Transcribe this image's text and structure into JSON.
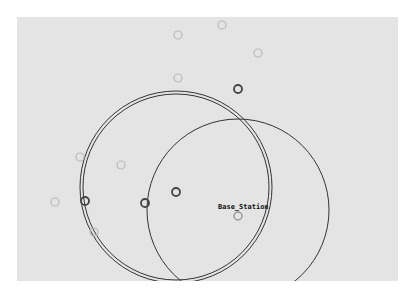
{
  "scene": {
    "panel": {
      "x": 17,
      "y": 17,
      "width": 381,
      "height": 264,
      "background": "#e4e4e4"
    },
    "base_station": {
      "label": "Base_Station",
      "x": 238,
      "y": 216
    },
    "range_circles": [
      {
        "name": "double-range-circle-outer",
        "cx": 176,
        "cy": 187,
        "r": 96
      },
      {
        "name": "double-range-circle-inner",
        "cx": 176,
        "cy": 187,
        "r": 93
      },
      {
        "name": "base-station-range-circle",
        "cx": 238,
        "cy": 210,
        "r": 91
      }
    ],
    "nodes": [
      {
        "x": 222,
        "y": 25,
        "state": "faint"
      },
      {
        "x": 178,
        "y": 35,
        "state": "faint"
      },
      {
        "x": 258,
        "y": 53,
        "state": "faint"
      },
      {
        "x": 178,
        "y": 78,
        "state": "faint"
      },
      {
        "x": 238,
        "y": 89,
        "state": "active"
      },
      {
        "x": 80,
        "y": 157,
        "state": "faint"
      },
      {
        "x": 121,
        "y": 165,
        "state": "faint"
      },
      {
        "x": 176,
        "y": 192,
        "state": "active"
      },
      {
        "x": 55,
        "y": 202,
        "state": "faint"
      },
      {
        "x": 85,
        "y": 201,
        "state": "active"
      },
      {
        "x": 145,
        "y": 203,
        "state": "active"
      },
      {
        "x": 94,
        "y": 232,
        "state": "faint"
      }
    ],
    "colors": {
      "faint": "#b8b8b8",
      "active": "#444444",
      "base": "#999999",
      "line": "#333333"
    }
  }
}
